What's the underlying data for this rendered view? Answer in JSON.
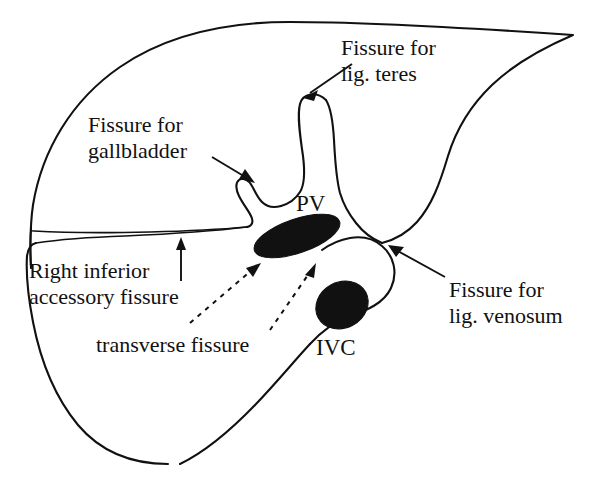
{
  "figure": {
    "background_color": "#ffffff",
    "line_color": "#111111",
    "width": 593,
    "height": 482
  },
  "labels": {
    "lig_teres": {
      "line1": "Fissure for",
      "line2": "lig. teres"
    },
    "gallbladder": {
      "line1": "Fissure for",
      "line2": "gallbladder"
    },
    "accessory": {
      "line1": "Right inferior",
      "line2": "accessory fissure"
    },
    "transverse": {
      "line1": "transverse fissure"
    },
    "lig_venosum": {
      "line1": "Fissure for",
      "line2": "lig. venosum"
    },
    "portal_vein": {
      "abbr": "PV"
    },
    "inferior_vena_cava": {
      "abbr": "IVC"
    }
  },
  "structures": [
    {
      "name": "portal-vein",
      "abbr": "PV",
      "shape": "elongated-oval",
      "fill": "#111111"
    },
    {
      "name": "inferior-vena-cava",
      "abbr": "IVC",
      "shape": "oval",
      "fill": "#111111"
    }
  ]
}
